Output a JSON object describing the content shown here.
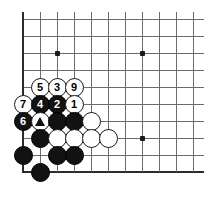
{
  "diagram": {
    "board": {
      "type": "go-board",
      "origin_x": 23,
      "origin_y": 19,
      "spacing": 17,
      "cols": 11,
      "rows": 10,
      "line_color": "#6b6b6b",
      "edge_color": "#2b2b2b",
      "background": "#ffffff",
      "edges": [
        "left",
        "bottom"
      ]
    },
    "star_points": [
      {
        "col": 2,
        "row": 2
      },
      {
        "col": 7,
        "row": 2
      },
      {
        "col": 7,
        "row": 7
      }
    ],
    "stones": [
      {
        "col": 1,
        "row": 4,
        "color": "white",
        "label": "5"
      },
      {
        "col": 2,
        "row": 4,
        "color": "white",
        "label": "3"
      },
      {
        "col": 3,
        "row": 4,
        "color": "white",
        "label": "9"
      },
      {
        "col": 0,
        "row": 5,
        "color": "white",
        "label": "7"
      },
      {
        "col": 1,
        "row": 5,
        "color": "black",
        "label": "4"
      },
      {
        "col": 2,
        "row": 5,
        "color": "black",
        "label": "2"
      },
      {
        "col": 3,
        "row": 5,
        "color": "white",
        "label": "1"
      },
      {
        "col": 0,
        "row": 6,
        "color": "black",
        "label": "6"
      },
      {
        "col": 1,
        "row": 6,
        "color": "white",
        "label": "",
        "mark": "triangle"
      },
      {
        "col": 2,
        "row": 6,
        "color": "black",
        "label": ""
      },
      {
        "col": 3,
        "row": 6,
        "color": "black",
        "label": ""
      },
      {
        "col": 4,
        "row": 6,
        "color": "white",
        "label": ""
      },
      {
        "col": 1,
        "row": 7,
        "color": "black",
        "label": ""
      },
      {
        "col": 2,
        "row": 7,
        "color": "white",
        "label": ""
      },
      {
        "col": 3,
        "row": 7,
        "color": "white",
        "label": ""
      },
      {
        "col": 4,
        "row": 7,
        "color": "white",
        "label": ""
      },
      {
        "col": 5,
        "row": 7,
        "color": "white",
        "label": ""
      },
      {
        "col": 0,
        "row": 8,
        "color": "black",
        "label": ""
      },
      {
        "col": 2,
        "row": 8,
        "color": "black",
        "label": ""
      },
      {
        "col": 3,
        "row": 8,
        "color": "black",
        "label": ""
      },
      {
        "col": 1,
        "row": 9,
        "color": "black",
        "label": ""
      }
    ],
    "marks": {
      "triangle_glyph": "triangle-mark"
    },
    "move_numbers": [
      "1",
      "2",
      "3",
      "4",
      "5",
      "6",
      "7",
      "9"
    ]
  }
}
